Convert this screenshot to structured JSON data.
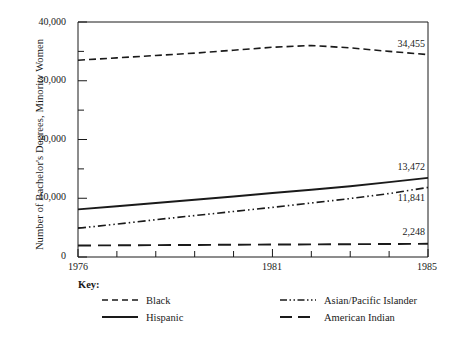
{
  "chart_data": {
    "type": "line",
    "title": "",
    "subtitle": "",
    "xlabel": "",
    "ylabel": "Number of Bachelor's Degrees, Minority Women",
    "x": [
      1976,
      1977,
      1978,
      1979,
      1980,
      1981,
      1982,
      1983,
      1984,
      1985
    ],
    "xlim": [
      1976,
      1985
    ],
    "ylim": [
      0,
      40000
    ],
    "grid": false,
    "legend_position": "below-plot",
    "x_tick_labels": [
      "1976",
      "1981",
      "1985"
    ],
    "x_tick_values": [
      1976,
      1981,
      1985
    ],
    "x_minor_ticks": [
      1977,
      1978,
      1979,
      1980,
      1982,
      1983,
      1984
    ],
    "y_tick_labels": [
      "0",
      "10,000",
      "20,000",
      "30,000",
      "40,000"
    ],
    "y_tick_values": [
      0,
      10000,
      20000,
      30000,
      40000
    ],
    "y_minor_tick_values": [
      5000,
      15000,
      25000,
      35000
    ],
    "series": [
      {
        "name": "Black",
        "style": "dashed",
        "color": "#1a1a1a",
        "values": [
          33500,
          33900,
          34300,
          34700,
          35200,
          35700,
          36000,
          35600,
          35000,
          34455
        ],
        "end_label": "34,455"
      },
      {
        "name": "Hispanic",
        "style": "solid",
        "color": "#1a1a1a",
        "values": [
          8100,
          8650,
          9200,
          9750,
          10300,
          10900,
          11450,
          12050,
          12750,
          13472
        ],
        "end_label": "13,472"
      },
      {
        "name": "Asian/Pacific Islander",
        "style": "dash-dot",
        "color": "#1a1a1a",
        "values": [
          4900,
          5600,
          6350,
          7050,
          7750,
          8450,
          9200,
          9950,
          10800,
          11841
        ],
        "end_label": "11,841"
      },
      {
        "name": "American Indian",
        "style": "long-dashed",
        "color": "#1a1a1a",
        "values": [
          1950,
          1990,
          2020,
          2050,
          2090,
          2120,
          2150,
          2180,
          2210,
          2248
        ],
        "end_label": "2,248"
      }
    ]
  },
  "legend": {
    "title": "Key:",
    "entries": [
      {
        "label": "Black",
        "style": "dashed"
      },
      {
        "label": "Hispanic",
        "style": "solid"
      },
      {
        "label": "Asian/Pacific Islander",
        "style": "dash-dot"
      },
      {
        "label": "American Indian",
        "style": "long-dashed"
      }
    ]
  },
  "axes": {
    "y_title": "Number of Bachelor's Degrees, Minority Women",
    "y_labels": [
      "40,000",
      "30,000",
      "20,000",
      "10,000",
      "0"
    ],
    "x_labels": [
      "1976",
      "1981",
      "1985"
    ]
  },
  "value_labels": [
    "34,455",
    "13,472",
    "11,841",
    "2,248"
  ]
}
